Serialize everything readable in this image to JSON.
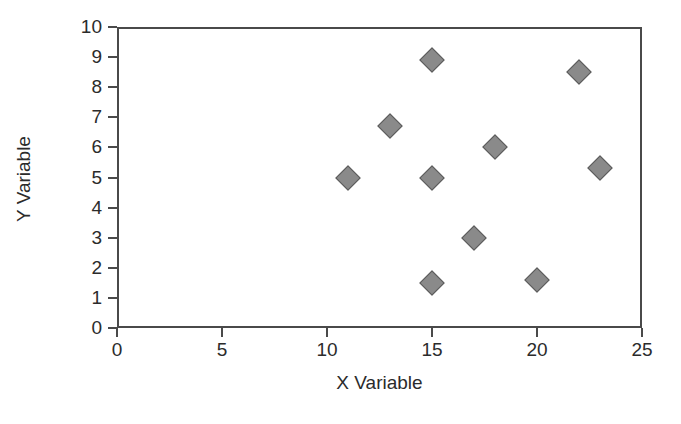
{
  "chart_data": {
    "type": "scatter",
    "title": "",
    "xlabel": "X Variable",
    "ylabel": "Y Variable",
    "xlim": [
      0,
      25
    ],
    "ylim": [
      0,
      10
    ],
    "xticks": [
      0,
      5,
      10,
      15,
      20,
      25
    ],
    "yticks": [
      0,
      1,
      2,
      3,
      4,
      5,
      6,
      7,
      8,
      9,
      10
    ],
    "xtick_labels": [
      "0",
      "5",
      "10",
      "15",
      "20",
      "25"
    ],
    "ytick_labels": [
      "0",
      "1",
      "2",
      "3",
      "4",
      "5",
      "6",
      "7",
      "8",
      "9",
      "10"
    ],
    "grid": false,
    "legend": null,
    "marker": "diamond",
    "marker_fill": "#8a8a8a",
    "marker_edge": "#5a5a5a",
    "frame_color": "#4a4a4a",
    "background": "#ffffff",
    "points": [
      {
        "x": 11,
        "y": 5.0
      },
      {
        "x": 13,
        "y": 6.7
      },
      {
        "x": 15,
        "y": 8.9
      },
      {
        "x": 15,
        "y": 5.0
      },
      {
        "x": 15,
        "y": 1.5
      },
      {
        "x": 17,
        "y": 3.0
      },
      {
        "x": 18,
        "y": 6.0
      },
      {
        "x": 20,
        "y": 1.6
      },
      {
        "x": 22,
        "y": 8.5
      },
      {
        "x": 23,
        "y": 5.3
      }
    ]
  }
}
